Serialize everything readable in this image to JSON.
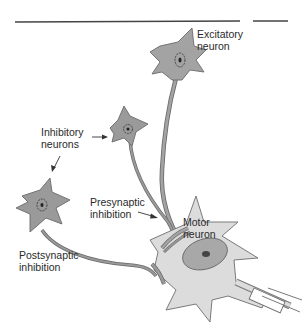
{
  "diagram": {
    "title_rule": true,
    "labels": {
      "excitatory": "Excitatory\nneuron",
      "inhibitory": "Inhibitory\nneurons",
      "presynaptic": "Presynaptic\ninhibition",
      "motor": "Motor\nneuron",
      "postsynaptic": "Postsynaptic\ninhibition"
    },
    "colors": {
      "inhibitory_fill": "#9a9a9a",
      "excitatory_fill": "#a3a3a3",
      "motor_fill": "#dcdcdc",
      "nucleus_fill": "#a0a0a0",
      "outline": "#5a5a5a",
      "rule": "#444444"
    }
  }
}
